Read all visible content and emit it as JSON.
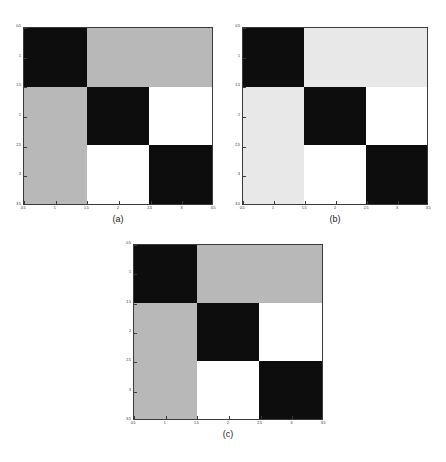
{
  "figure": {
    "background": "#ffffff",
    "width": 446,
    "height": 462,
    "axis_color": "#3a3a3a",
    "label_color": "#1a1a1a"
  },
  "palette": {
    "black": "#0d0d0d",
    "white": "#ffffff",
    "gray_medium": "#b8b8b8",
    "gray_light": "#e8e8e8"
  },
  "captions": {
    "a": "(a)",
    "b": "(b)",
    "c": "(c)"
  },
  "axis": {
    "xticks": [
      "0.5",
      "1",
      "1.5",
      "2",
      "2.5",
      "3",
      "3.5"
    ],
    "yticks": [
      "0.5",
      "1",
      "1.5",
      "2",
      "2.5",
      "3",
      "3.5"
    ],
    "xlim": [
      0.5,
      3.5
    ],
    "ylim": [
      0.5,
      3.5
    ],
    "xlabel": "",
    "ylabel": ""
  },
  "chart_data": [
    {
      "type": "heatmap",
      "panel": "a",
      "title": "(a)",
      "xlabel": "",
      "ylabel": "",
      "xlim": [
        0.5,
        3.5
      ],
      "ylim": [
        3.5,
        0.5
      ],
      "xticks": [
        "0.5",
        "1",
        "1.5",
        "2",
        "2.5",
        "3",
        "3.5"
      ],
      "yticks": [
        "0.5",
        "1",
        "1.5",
        "2",
        "2.5",
        "3",
        "3.5"
      ],
      "grid": false,
      "legend": "none",
      "rows": 3,
      "cols": 3,
      "colormap": "gray",
      "values": [
        [
          0.0,
          0.72,
          0.72
        ],
        [
          0.72,
          0.0,
          1.0
        ],
        [
          0.72,
          1.0,
          0.0
        ]
      ],
      "colors": [
        [
          "#0d0d0d",
          "#b8b8b8",
          "#b8b8b8"
        ],
        [
          "#b8b8b8",
          "#0d0d0d",
          "#ffffff"
        ],
        [
          "#b8b8b8",
          "#ffffff",
          "#0d0d0d"
        ]
      ]
    },
    {
      "type": "heatmap",
      "panel": "b",
      "title": "(b)",
      "xlabel": "",
      "ylabel": "",
      "xlim": [
        0.5,
        3.5
      ],
      "ylim": [
        3.5,
        0.5
      ],
      "xticks": [
        "0.5",
        "1",
        "1.5",
        "2",
        "2.5",
        "3",
        "3.5"
      ],
      "yticks": [
        "0.5",
        "1",
        "1.5",
        "2",
        "2.5",
        "3",
        "3.5"
      ],
      "grid": false,
      "legend": "none",
      "rows": 3,
      "cols": 3,
      "colormap": "gray",
      "values": [
        [
          0.0,
          0.91,
          0.91
        ],
        [
          0.91,
          0.0,
          1.0
        ],
        [
          0.91,
          1.0,
          0.0
        ]
      ],
      "colors": [
        [
          "#0d0d0d",
          "#e8e8e8",
          "#e8e8e8"
        ],
        [
          "#e8e8e8",
          "#0d0d0d",
          "#ffffff"
        ],
        [
          "#e8e8e8",
          "#ffffff",
          "#0d0d0d"
        ]
      ]
    },
    {
      "type": "heatmap",
      "panel": "c",
      "title": "(c)",
      "xlabel": "",
      "ylabel": "",
      "xlim": [
        0.5,
        3.5
      ],
      "ylim": [
        3.5,
        0.5
      ],
      "xticks": [
        "0.5",
        "1",
        "1.5",
        "2",
        "2.5",
        "3",
        "3.5"
      ],
      "yticks": [
        "0.5",
        "1",
        "1.5",
        "2",
        "2.5",
        "3",
        "3.5"
      ],
      "grid": false,
      "legend": "none",
      "rows": 3,
      "cols": 3,
      "colormap": "gray",
      "values": [
        [
          0.0,
          0.72,
          0.72
        ],
        [
          0.72,
          0.0,
          1.0
        ],
        [
          0.72,
          1.0,
          0.0
        ]
      ],
      "colors": [
        [
          "#0d0d0d",
          "#b8b8b8",
          "#b8b8b8"
        ],
        [
          "#b8b8b8",
          "#0d0d0d",
          "#ffffff"
        ],
        [
          "#b8b8b8",
          "#ffffff",
          "#0d0d0d"
        ]
      ]
    }
  ],
  "layout": {
    "panels": [
      {
        "key": "a",
        "left": 23,
        "top": 27,
        "width": 190,
        "height": 178
      },
      {
        "key": "b",
        "left": 242,
        "top": 27,
        "width": 186,
        "height": 178
      },
      {
        "key": "c",
        "left": 133,
        "top": 244,
        "width": 190,
        "height": 176
      }
    ]
  }
}
